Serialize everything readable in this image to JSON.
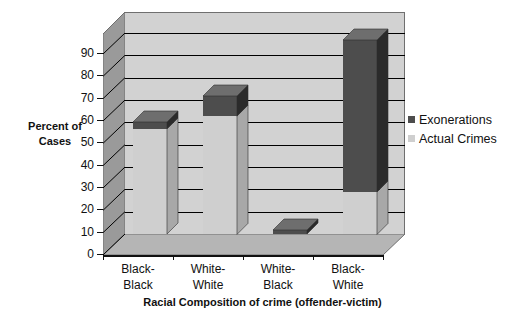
{
  "chart_data": {
    "type": "bar",
    "subtype": "stacked-3d-column",
    "title": "",
    "xlabel": "Racial Composition of crime (offender-victim)",
    "ylabel": "Percent of Cases",
    "categories": [
      "Black-Black",
      "White-White",
      "White-Black",
      "Black-White"
    ],
    "category_lines": [
      [
        "Black-",
        "Black"
      ],
      [
        "White-",
        "White"
      ],
      [
        "White-",
        "Black"
      ],
      [
        "Black-",
        "White"
      ]
    ],
    "series": [
      {
        "name": "Actual Crimes",
        "color": "#cfcfcf",
        "values": [
          47,
          53,
          0,
          19
        ]
      },
      {
        "name": "Exonerations",
        "color": "#4d4d4d",
        "values": [
          3,
          9,
          1,
          68
        ]
      }
    ],
    "stack_totals": [
      50,
      62,
      1,
      87
    ],
    "ylim": [
      0,
      90
    ],
    "ytick_values": [
      0,
      10,
      20,
      30,
      40,
      50,
      60,
      70,
      80,
      90
    ],
    "ytick_labels": [
      "0",
      "10",
      "20",
      "30",
      "40",
      "50",
      "60",
      "70",
      "80",
      "90"
    ],
    "grid": true,
    "legend_position": "right",
    "legend": [
      {
        "label": "Exonerations",
        "color": "#4d4d4d"
      },
      {
        "label": "Actual Crimes",
        "color": "#cfcfcf"
      }
    ],
    "colors": {
      "plot_back": "#d2d2d2",
      "plot_side": "#9a9a9a",
      "plot_floor": "#b5b5b5",
      "gridline": "#000000",
      "axis": "#111111",
      "text": "#111111",
      "series_light": "#cfcfcf",
      "series_light_side": "#a8a8a8",
      "series_light_top": "#e3e3e3",
      "series_dark": "#4d4d4d",
      "series_dark_side": "#2b2b2b",
      "series_dark_top": "#6e6e6e"
    }
  }
}
